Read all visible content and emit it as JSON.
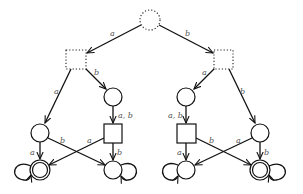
{
  "diagram": {
    "type": "automaton-tree",
    "background": "#ffffff",
    "stroke_color": "#111111",
    "label_color": "#555555",
    "nodes": [
      {
        "id": "root",
        "shape": "circle",
        "style": "dotted",
        "x": 150,
        "y": 20
      },
      {
        "id": "L",
        "shape": "square",
        "style": "dotted",
        "x": 76,
        "y": 59
      },
      {
        "id": "R",
        "shape": "square",
        "style": "dotted",
        "x": 224,
        "y": 59
      },
      {
        "id": "L_in",
        "shape": "circle",
        "style": "solid",
        "x": 113,
        "y": 97
      },
      {
        "id": "R_in",
        "shape": "circle",
        "style": "solid",
        "x": 186,
        "y": 97
      },
      {
        "id": "L_c",
        "shape": "circle",
        "style": "solid",
        "x": 40,
        "y": 133
      },
      {
        "id": "L_sq",
        "shape": "square",
        "style": "solid",
        "x": 113,
        "y": 133
      },
      {
        "id": "R_sq",
        "shape": "square",
        "style": "solid",
        "x": 186,
        "y": 133
      },
      {
        "id": "R_c",
        "shape": "circle",
        "style": "solid",
        "x": 260,
        "y": 133
      },
      {
        "id": "L_acc",
        "shape": "double-circle",
        "style": "solid",
        "x": 40,
        "y": 170,
        "loop": "left"
      },
      {
        "id": "L_bot",
        "shape": "circle",
        "style": "solid",
        "x": 113,
        "y": 170,
        "loop": "right"
      },
      {
        "id": "R_bot",
        "shape": "circle",
        "style": "solid",
        "x": 186,
        "y": 170,
        "loop": "left"
      },
      {
        "id": "R_acc",
        "shape": "double-circle",
        "style": "solid",
        "x": 260,
        "y": 170,
        "loop": "right"
      }
    ],
    "edges": [
      {
        "from": "root",
        "to": "L",
        "label": "a"
      },
      {
        "from": "root",
        "to": "R",
        "label": "b"
      },
      {
        "from": "L",
        "to": "L_c",
        "label": "a"
      },
      {
        "from": "L",
        "to": "L_in",
        "label": "b"
      },
      {
        "from": "R",
        "to": "R_in",
        "label": "a"
      },
      {
        "from": "R",
        "to": "R_c",
        "label": "b"
      },
      {
        "from": "L_in",
        "to": "L_sq",
        "label": "a, b"
      },
      {
        "from": "R_in",
        "to": "R_sq",
        "label": "a, b"
      },
      {
        "from": "L_c",
        "to": "L_acc",
        "label": "a"
      },
      {
        "from": "L_c",
        "to": "L_bot",
        "label": "b"
      },
      {
        "from": "L_sq",
        "to": "L_acc",
        "label": "a"
      },
      {
        "from": "L_sq",
        "to": "L_bot",
        "label": "b"
      },
      {
        "from": "R_sq",
        "to": "R_bot",
        "label": "a"
      },
      {
        "from": "R_sq",
        "to": "R_acc",
        "label": "b"
      },
      {
        "from": "R_c",
        "to": "R_bot",
        "label": "a"
      },
      {
        "from": "R_c",
        "to": "R_acc",
        "label": "b"
      }
    ],
    "labels": {
      "root_L": "a",
      "root_R": "b",
      "L_Lc": "a",
      "L_Lin": "b",
      "R_Rin": "a",
      "R_Rc": "b",
      "Lin_Lsq": "a, b",
      "Rin_Rsq": "a, b",
      "Lc_Lacc": "a",
      "Lc_Lbot": "b",
      "Lsq_Lacc": "a",
      "Lsq_Lbot": "b",
      "Rsq_Rbot": "a",
      "Rsq_Racc": "b",
      "Rc_Rbot": "a",
      "Rc_Racc": "b"
    }
  }
}
